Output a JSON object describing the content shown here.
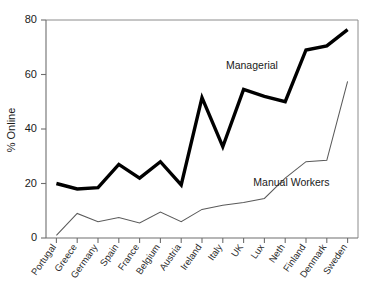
{
  "chart_data": {
    "type": "line",
    "title": "",
    "xlabel": "",
    "ylabel": "% Online",
    "ylim": [
      0,
      80
    ],
    "yticks": [
      0,
      20,
      40,
      60,
      80
    ],
    "ytick_labels": [
      "0",
      "20",
      "40",
      "60",
      "80"
    ],
    "grid": false,
    "legend_position": "inline-annotation",
    "categories": [
      "Portugal",
      "Greece",
      "Germany",
      "Spain",
      "France",
      "Belgium",
      "Austria",
      "Ireland",
      "Italy",
      "UK",
      "Lux",
      "Neth",
      "Finland",
      "Denmark",
      "Sweden"
    ],
    "series": [
      {
        "name": "Managerial",
        "values": [
          20,
          18,
          18.5,
          27,
          22,
          28,
          19.5,
          51.5,
          33.5,
          54.5,
          52,
          50,
          69,
          70.5,
          76.5
        ],
        "color": "#000000",
        "line_width": 3.4,
        "annotation": "Managerial"
      },
      {
        "name": "Manual Workers",
        "values": [
          1,
          9,
          6,
          7.5,
          5.5,
          9.5,
          6,
          10.5,
          12,
          13,
          14.5,
          22,
          28,
          28.5,
          57.5
        ],
        "color": "#5a5a5a",
        "line_width": 1.05,
        "annotation": "Manual Workers"
      }
    ],
    "annotations": [
      {
        "text": "Managerial",
        "x_index": 9.4,
        "y_value": 62
      },
      {
        "text": "Manual Workers",
        "x_index": 11.3,
        "y_value": 19
      }
    ]
  },
  "axes": {
    "y_axis_label": "% Online"
  }
}
